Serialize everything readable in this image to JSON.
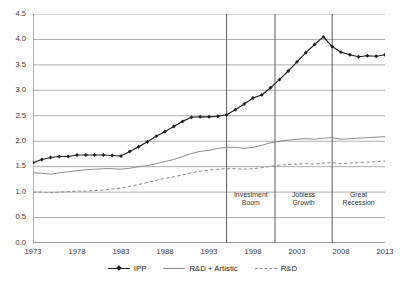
{
  "chart_data": {
    "type": "line",
    "title": "",
    "subtitle": "",
    "xlabel": "",
    "ylabel": "",
    "xlim": [
      1973,
      2013
    ],
    "ylim": [
      0.0,
      4.5
    ],
    "grid": true,
    "legend_position": "bottom",
    "y_ticks": [
      "0.0",
      "0.5",
      "1.0",
      "1.5",
      "2.0",
      "2.5",
      "3.0",
      "3.5",
      "4.0",
      "4.5"
    ],
    "y_tick_values": [
      0.0,
      0.5,
      1.0,
      1.5,
      2.0,
      2.5,
      3.0,
      3.5,
      4.0,
      4.5
    ],
    "x_ticks": [
      "1973",
      "1978",
      "1983",
      "1988",
      "1993",
      "1998",
      "2003",
      "2008",
      "2013"
    ],
    "x_tick_values": [
      1973,
      1978,
      1983,
      1988,
      1993,
      1998,
      2003,
      2008,
      2013
    ],
    "x": [
      1973,
      1974,
      1975,
      1976,
      1977,
      1978,
      1979,
      1980,
      1981,
      1982,
      1983,
      1984,
      1985,
      1986,
      1987,
      1988,
      1989,
      1990,
      1991,
      1992,
      1993,
      1994,
      1995,
      1996,
      1997,
      1998,
      1999,
      2000,
      2001,
      2002,
      2003,
      2004,
      2005,
      2006,
      2007,
      2008,
      2009,
      2010,
      2011,
      2012,
      2013
    ],
    "series": [
      {
        "name": "IPP",
        "color": "#231f20",
        "style": "solid-markers",
        "marker": "diamond",
        "values": [
          1.58,
          1.64,
          1.68,
          1.7,
          1.7,
          1.73,
          1.73,
          1.73,
          1.73,
          1.72,
          1.71,
          1.8,
          1.89,
          1.99,
          2.1,
          2.19,
          2.29,
          2.39,
          2.47,
          2.48,
          2.48,
          2.49,
          2.52,
          2.62,
          2.73,
          2.85,
          2.91,
          3.05,
          3.21,
          3.38,
          3.56,
          3.74,
          3.9,
          4.05,
          3.86,
          3.75,
          3.7,
          3.66,
          3.68,
          3.67,
          3.7
        ]
      },
      {
        "name": "R&D + Artistic",
        "color": "#8c8c8c",
        "style": "solid",
        "marker": "none",
        "values": [
          1.38,
          1.37,
          1.35,
          1.38,
          1.4,
          1.42,
          1.44,
          1.45,
          1.46,
          1.46,
          1.45,
          1.47,
          1.5,
          1.52,
          1.56,
          1.6,
          1.64,
          1.7,
          1.76,
          1.8,
          1.82,
          1.86,
          1.88,
          1.88,
          1.86,
          1.88,
          1.92,
          1.97,
          2.0,
          2.02,
          2.04,
          2.05,
          2.04,
          2.06,
          2.07,
          2.04,
          2.05,
          2.06,
          2.07,
          2.08,
          2.09
        ]
      },
      {
        "name": "R&D",
        "color": "#8c8c8c",
        "style": "dashed",
        "marker": "none",
        "values": [
          1.0,
          1.0,
          0.99,
          1.0,
          1.01,
          1.02,
          1.02,
          1.03,
          1.04,
          1.06,
          1.08,
          1.11,
          1.15,
          1.19,
          1.23,
          1.27,
          1.3,
          1.34,
          1.38,
          1.41,
          1.43,
          1.45,
          1.46,
          1.46,
          1.45,
          1.46,
          1.48,
          1.51,
          1.53,
          1.54,
          1.55,
          1.56,
          1.55,
          1.57,
          1.58,
          1.56,
          1.57,
          1.58,
          1.59,
          1.6,
          1.61
        ]
      }
    ],
    "annotations": [
      {
        "label_line1": "Investment",
        "label_line2": "Boom",
        "start": 1995.0,
        "end": 2000.5
      },
      {
        "label_line1": "Jobless",
        "label_line2": "Growth",
        "start": 2000.5,
        "end": 2007.0
      },
      {
        "label_line1": "Great",
        "label_line2": "Recession",
        "start": 2007.0,
        "end": 2013.0
      }
    ],
    "dividers": [
      1995.0,
      2000.5,
      2007.0
    ]
  },
  "legend": {
    "items": [
      {
        "label": "IPP"
      },
      {
        "label": "R&D + Artistic"
      },
      {
        "label": "R&D"
      }
    ]
  },
  "colors": {
    "ipp": "#231f20",
    "grey": "#8c8c8c",
    "grid": "#9a9a9a",
    "axis": "#6b6b6b"
  }
}
